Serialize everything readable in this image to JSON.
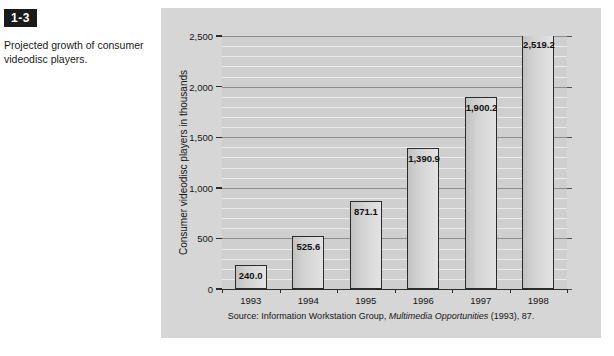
{
  "figure": {
    "badge": "1-3",
    "caption": "Projected growth of consumer videodisc players."
  },
  "chart_data": {
    "type": "bar",
    "title": "",
    "categories": [
      "1993",
      "1994",
      "1995",
      "1996",
      "1997",
      "1998"
    ],
    "values": [
      240.0,
      525.6,
      871.1,
      1390.9,
      1900.2,
      2519.2
    ],
    "value_labels": [
      "240.0",
      "525.6",
      "871.1",
      "1,390.9",
      "1,900.2",
      "2,519.2"
    ],
    "xlabel": "",
    "ylabel": "Consumer videodisc players in thousands",
    "ylim": [
      0,
      2500
    ],
    "ytick_values": [
      0,
      500,
      1000,
      1500,
      2000,
      2500
    ],
    "ytick_labels": [
      "0",
      "500",
      "1,000",
      "1,500",
      "2,000",
      "2,500"
    ],
    "minor_gridlines": true,
    "minor_tick_step": 100,
    "grid": true,
    "legend": "none",
    "source_prefix": "Source: Information Workstation Group, ",
    "source_italic": "Multimedia Opportunities",
    "source_suffix": " (1993), 87.",
    "colors": {
      "plot_background": "#cfcfcf",
      "panel_background": "#d6d6d6",
      "bar_fill": "#d8d8d8",
      "bar_border": "#2b2b2b",
      "major_gridline": "#8d8d8d",
      "minor_gridline": "#eceaea",
      "axis": "#2b2b2b",
      "text": "#151515"
    }
  }
}
